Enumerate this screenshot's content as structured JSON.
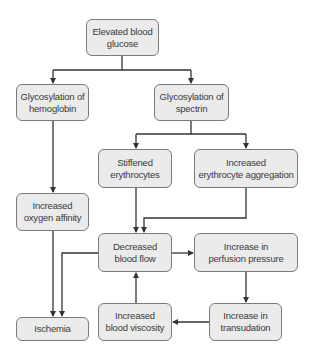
{
  "diagram": {
    "type": "flowchart",
    "colors": {
      "box_fill": "#ebebeb",
      "box_border": "#7a7a7a",
      "line": "#333333",
      "text": "#3a3a3a"
    },
    "nodes": {
      "glucose": {
        "label": "Elevated blood\nglucose"
      },
      "hemoglobin": {
        "label": "Glycosylation of\nhemoglobin"
      },
      "spectrin": {
        "label": "Glycosylation of\nspectrin"
      },
      "stiffened": {
        "label": "Stiffened\nerythrocytes"
      },
      "aggregation": {
        "label": "Increased\nerythrocyte aggregation"
      },
      "oxygen": {
        "label": "Increased\noxygen affinity"
      },
      "flow": {
        "label": "Decreased\nblood flow"
      },
      "perfusion": {
        "label": "Increase in\nperfusion pressure"
      },
      "ischemia": {
        "label": "Ischemia"
      },
      "viscosity": {
        "label": "Increased\nblood viscosity"
      },
      "transudation": {
        "label": "Increase in\ntransudation"
      }
    },
    "edges": [
      {
        "from": "glucose",
        "to": "hemoglobin"
      },
      {
        "from": "glucose",
        "to": "spectrin"
      },
      {
        "from": "hemoglobin",
        "to": "oxygen"
      },
      {
        "from": "spectrin",
        "to": "stiffened"
      },
      {
        "from": "spectrin",
        "to": "aggregation"
      },
      {
        "from": "stiffened",
        "to": "flow"
      },
      {
        "from": "aggregation",
        "to": "flow"
      },
      {
        "from": "oxygen",
        "to": "ischemia"
      },
      {
        "from": "flow",
        "to": "ischemia"
      },
      {
        "from": "flow",
        "to": "perfusion"
      },
      {
        "from": "perfusion",
        "to": "transudation"
      },
      {
        "from": "transudation",
        "to": "viscosity"
      },
      {
        "from": "viscosity",
        "to": "flow"
      }
    ]
  }
}
